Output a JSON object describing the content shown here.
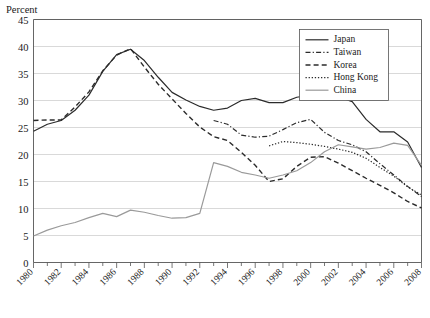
{
  "chart_data": {
    "type": "line",
    "title": "",
    "ylabel": "Percent",
    "xlabel": "",
    "ylim": [
      0,
      45
    ],
    "ytick_step": 5,
    "yticks": [
      0,
      5,
      10,
      15,
      20,
      25,
      30,
      35,
      40,
      45
    ],
    "xlim": [
      1980,
      2008
    ],
    "xticks": [
      1980,
      1981,
      1982,
      1983,
      1984,
      1985,
      1986,
      1987,
      1988,
      1989,
      1990,
      1991,
      1992,
      1993,
      1994,
      1995,
      1996,
      1997,
      1998,
      1999,
      2000,
      2001,
      2002,
      2003,
      2004,
      2005,
      2006,
      2007,
      2008
    ],
    "xtick_labels": [
      "1980",
      "",
      "1982",
      "",
      "1984",
      "",
      "1986",
      "",
      "1988",
      "",
      "1990",
      "",
      "1992",
      "",
      "1994",
      "",
      "1996",
      "",
      "1998",
      "",
      "2000",
      "",
      "2002",
      "",
      "2004",
      "",
      "2006",
      "",
      "2008"
    ],
    "grid": "horizontal",
    "legend_position": "top-right",
    "series": [
      {
        "name": "Japan",
        "style": "solid",
        "color": "#2b2b2b",
        "width": 1.2,
        "x": [
          1980,
          1981,
          1982,
          1983,
          1984,
          1985,
          1986,
          1987,
          1988,
          1989,
          1990,
          1991,
          1992,
          1993,
          1994,
          1995,
          1996,
          1997,
          1998,
          1999,
          2000,
          2001,
          2002,
          2003,
          2004,
          2005,
          2006,
          2007,
          2008
        ],
        "values": [
          24.3,
          25.6,
          26.3,
          28.2,
          31.0,
          35.4,
          38.5,
          39.5,
          37.4,
          34.3,
          31.5,
          30.1,
          28.9,
          28.2,
          28.6,
          30.0,
          30.4,
          29.6,
          29.6,
          30.6,
          31.0,
          30.8,
          30.7,
          29.8,
          26.5,
          24.2,
          24.2,
          22.3,
          17.6
        ]
      },
      {
        "name": "Taiwan",
        "style": "dashdot",
        "color": "#2b2b2b",
        "width": 1.2,
        "x": [
          1993,
          1994,
          1995,
          1996,
          1997,
          1998,
          1999,
          2000,
          2001,
          2002,
          2003,
          2004,
          2005,
          2006,
          2007,
          2008
        ],
        "values": [
          26.3,
          25.6,
          23.6,
          23.2,
          23.4,
          24.6,
          25.9,
          26.5,
          24.1,
          22.6,
          21.8,
          20.5,
          18.3,
          16.2,
          14.1,
          12.2
        ]
      },
      {
        "name": "Korea",
        "style": "dashed",
        "color": "#2b2b2b",
        "width": 1.4,
        "x": [
          1980,
          1981,
          1982,
          1983,
          1984,
          1985,
          1986,
          1987,
          1988,
          1989,
          1990,
          1991,
          1992,
          1993,
          1994,
          1995,
          1996,
          1997,
          1998,
          1999,
          2000,
          2001,
          2002,
          2003,
          2004,
          2005,
          2006,
          2007,
          2008
        ],
        "values": [
          26.3,
          26.4,
          26.4,
          28.8,
          31.6,
          35.5,
          38.4,
          39.6,
          36.2,
          33.0,
          30.3,
          27.6,
          25.1,
          23.3,
          22.6,
          20.4,
          18.0,
          15.0,
          15.5,
          17.8,
          19.5,
          19.6,
          18.4,
          17.0,
          15.6,
          14.3,
          12.9,
          11.3,
          10.1
        ]
      },
      {
        "name": "Hong Kong",
        "style": "dotted",
        "color": "#2b2b2b",
        "width": 1.2,
        "x": [
          1997,
          1998,
          1999,
          2000,
          2001,
          2002,
          2003,
          2004,
          2005,
          2006,
          2007,
          2008
        ],
        "values": [
          21.6,
          22.4,
          22.2,
          21.9,
          21.5,
          21.0,
          20.4,
          19.3,
          17.6,
          16.0,
          14.0,
          12.5
        ]
      },
      {
        "name": "China",
        "style": "solid",
        "color": "#9a9a9a",
        "width": 1.2,
        "x": [
          1980,
          1981,
          1982,
          1983,
          1984,
          1985,
          1986,
          1987,
          1988,
          1989,
          1990,
          1991,
          1992,
          1993,
          1994,
          1995,
          1996,
          1997,
          1998,
          1999,
          2000,
          2001,
          2002,
          2003,
          2004,
          2005,
          2006,
          2007,
          2008
        ],
        "values": [
          4.9,
          6.0,
          6.8,
          7.4,
          8.3,
          9.1,
          8.5,
          9.7,
          9.3,
          8.7,
          8.2,
          8.3,
          9.1,
          18.5,
          17.8,
          16.7,
          16.2,
          15.6,
          16.2,
          17.0,
          18.5,
          20.5,
          21.8,
          21.4,
          21.0,
          21.3,
          22.1,
          21.7,
          18.0
        ]
      }
    ]
  },
  "legend": {
    "entries": [
      {
        "label": "Japan"
      },
      {
        "label": "Taiwan"
      },
      {
        "label": "Korea"
      },
      {
        "label": "Hong Kong"
      },
      {
        "label": "China"
      }
    ]
  }
}
